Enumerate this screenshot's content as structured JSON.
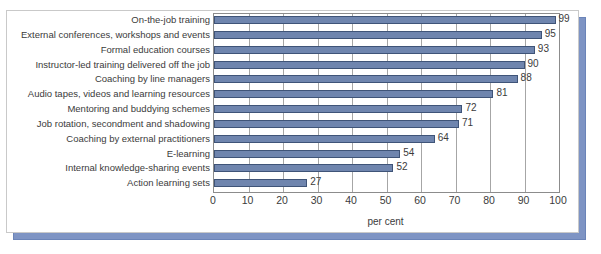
{
  "chart_data": {
    "type": "bar",
    "orientation": "horizontal",
    "title": "",
    "xlabel": "per cent",
    "ylabel": "",
    "xlim": [
      0,
      100
    ],
    "xticks": [
      0,
      10,
      20,
      30,
      40,
      50,
      60,
      70,
      80,
      90,
      100
    ],
    "grid": true,
    "legend": false,
    "categories": [
      "On-the-job training",
      "External conferences, workshops and events",
      "Formal education courses",
      "Instructor-led training delivered off the job",
      "Coaching by line managers",
      "Audio tapes, videos and learning resources",
      "Mentoring and buddying schemes",
      "Job rotation, secondment and shadowing",
      "Coaching by external practitioners",
      "E-learning",
      "Internal knowledge-sharing events",
      "Action learning sets"
    ],
    "values": [
      99,
      95,
      93,
      90,
      88,
      81,
      72,
      71,
      64,
      54,
      52,
      27
    ],
    "value_labels": [
      "99",
      "95",
      "93",
      "90",
      "88",
      "81",
      "72",
      "71",
      "64",
      "54",
      "52",
      "27"
    ],
    "colors": {
      "bar_fill": "#6f85ae",
      "bar_stroke": "#3f5478",
      "gridline": "#a6a6a6",
      "axis": "#8c8c8c",
      "text": "#3b3b3b",
      "card_border": "#c9c9c9",
      "card_shadow": "#7e94c4",
      "background": "#ffffff"
    }
  }
}
